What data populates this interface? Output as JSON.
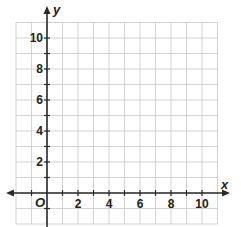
{
  "diagram": {
    "type": "coordinate-plane",
    "x_axis": {
      "label": "x",
      "min": -2,
      "max": 11,
      "tick_labels": [
        "2",
        "4",
        "6",
        "8",
        "10"
      ],
      "tick_values": [
        2,
        4,
        6,
        8,
        10
      ]
    },
    "y_axis": {
      "label": "y",
      "min": -2,
      "max": 11,
      "tick_labels": [
        "2",
        "4",
        "6",
        "8",
        "10"
      ],
      "tick_values": [
        2,
        4,
        6,
        8,
        10
      ]
    },
    "origin_label": "O",
    "grid": true,
    "grid_unit": 1,
    "colors": {
      "grid": "#c8c8c8",
      "axis": "#2a2a2a",
      "background": "#ffffff"
    }
  }
}
